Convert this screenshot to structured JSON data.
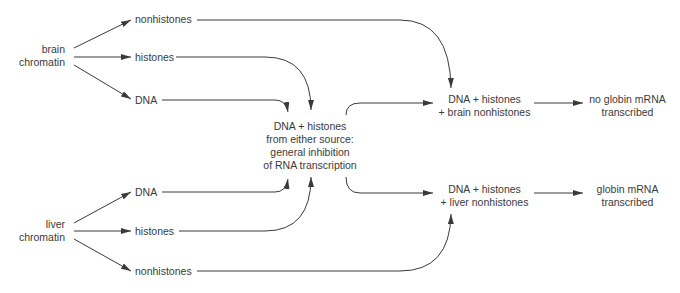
{
  "sources": {
    "brain": {
      "line1": "brain",
      "line2": "chromatin"
    },
    "liver": {
      "line1": "liver",
      "line2": "chromatin"
    }
  },
  "brain_fractions": [
    "nonhistones",
    "histones",
    "DNA"
  ],
  "liver_fractions": [
    "DNA",
    "histones",
    "nonhistones"
  ],
  "center": {
    "line1": "DNA  +  histones",
    "line2": "from either source:",
    "line3": "general inhibition",
    "line4": "of RNA transcription"
  },
  "brain_combo": {
    "line1": "DNA  +  histones",
    "line2": "+  brain nonhistones"
  },
  "liver_combo": {
    "line1": "DNA  +  histones",
    "line2": "+  liver nonhistones"
  },
  "brain_result": {
    "line1": "no globin mRNA",
    "line2": "transcribed"
  },
  "liver_result": {
    "line1": "globin mRNA",
    "line2": "transcribed"
  },
  "colors": {
    "ink": "#3a3a3a",
    "background": "#ffffff"
  }
}
